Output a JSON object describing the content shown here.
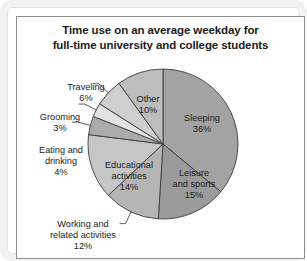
{
  "chart_data": {
    "type": "pie",
    "title": "Time use on an average weekday for full-time university and college students",
    "title_line1": "Time use on an average weekday for",
    "title_line2": "full-time university and college students",
    "xlabel": "",
    "ylabel": "",
    "legend_position": "none",
    "grid": false,
    "units": "percent",
    "total": 100,
    "categories": [
      "Sleeping",
      "Leisure and sports",
      "Working and related activities",
      "Educational activities",
      "Eating and drinking",
      "Grooming",
      "Traveling",
      "Other"
    ],
    "values": [
      36,
      15,
      12,
      14,
      4,
      3,
      6,
      10
    ],
    "slices": [
      {
        "name": "Sleeping",
        "label_line1": "Sleeping",
        "label_value": "36%",
        "value": 36,
        "color": "#a3a3a3",
        "label_placement": "inside",
        "label_x": 186,
        "label_y": 105
      },
      {
        "name": "Leisure and sports",
        "label_line1": "Leisure",
        "label_line2": "and sports",
        "label_value": "15%",
        "value": 15,
        "color": "#9b9b9b",
        "label_placement": "inside",
        "label_x": 178,
        "label_y": 160
      },
      {
        "name": "Working and related activities",
        "label_line1": "Working and",
        "label_line2": "related activities",
        "label_value": "12%",
        "value": 12,
        "color": "#b5b5b5",
        "label_placement": "outside",
        "label_x": 67,
        "label_y": 211
      },
      {
        "name": "Educational activities",
        "label_line1": "Educational",
        "label_line2": "activities",
        "label_value": "14%",
        "value": 14,
        "color": "#c6c6c6",
        "label_placement": "inside",
        "label_x": 113,
        "label_y": 152
      },
      {
        "name": "Eating and drinking",
        "label_line1": "Eating and",
        "label_line2": "drinking",
        "label_value": "4%",
        "value": 4,
        "color": "#ababab",
        "label_placement": "outside",
        "label_x": 45,
        "label_y": 137
      },
      {
        "name": "Grooming",
        "label_line1": "Grooming",
        "label_value": "3%",
        "value": 3,
        "color": "#e2e2e2",
        "label_placement": "outside",
        "label_x": 44,
        "label_y": 104
      },
      {
        "name": "Traveling",
        "label_line1": "Traveling",
        "label_value": "6%",
        "value": 6,
        "color": "#cfcfcf",
        "label_placement": "outside",
        "label_x": 70,
        "label_y": 74
      },
      {
        "name": "Other",
        "label_line1": "Other",
        "label_value": "10%",
        "value": 10,
        "color": "#bdbdbd",
        "label_placement": "inside",
        "label_x": 132,
        "label_y": 86
      }
    ],
    "geometry": {
      "center_x": 147,
      "center_y": 128,
      "radius": 75,
      "start_angle_deg": 0,
      "direction": "clockwise"
    },
    "style": {
      "slice_stroke": "#3c3c3c",
      "background": "#ffffff",
      "frame_color": "#f2f2f2",
      "inner_border_color": "#8f8f8f",
      "text_color": "#1b1b1b"
    }
  }
}
